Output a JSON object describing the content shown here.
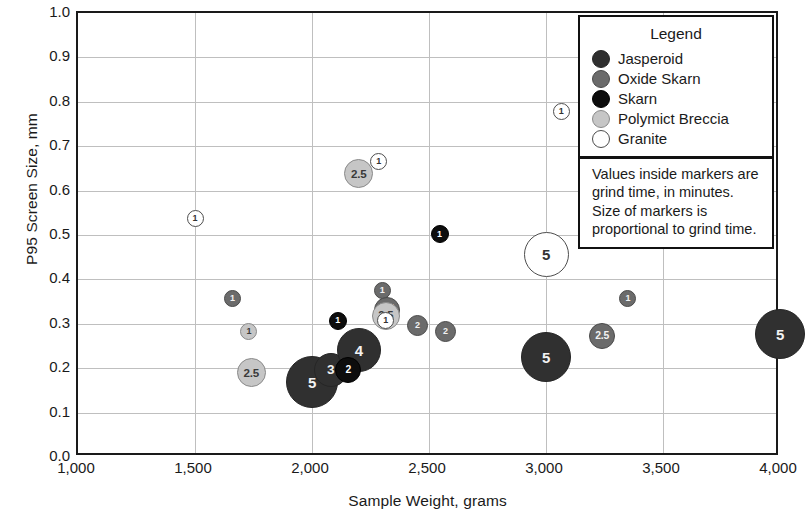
{
  "chart_data": {
    "type": "scatter",
    "title": "",
    "xlabel": "Sample Weight, grams",
    "ylabel": "P95 Screen Size, mm",
    "xlim": [
      1000,
      4000
    ],
    "ylim": [
      0.0,
      1.0
    ],
    "xticks": [
      "1,000",
      "1,500",
      "2,000",
      "2,500",
      "3,000",
      "3,500",
      "4,000"
    ],
    "xtick_values": [
      1000,
      1500,
      2000,
      2500,
      3000,
      3500,
      4000
    ],
    "yticks": [
      "0.0",
      "0.1",
      "0.2",
      "0.3",
      "0.4",
      "0.5",
      "0.6",
      "0.7",
      "0.8",
      "0.9",
      "1.0"
    ],
    "ytick_values": [
      0.0,
      0.1,
      0.2,
      0.3,
      0.4,
      0.5,
      0.6,
      0.7,
      0.8,
      0.9,
      1.0
    ],
    "grid": true,
    "legend_position": "top-right",
    "size_encoding": "marker area proportional to grind time (minutes)",
    "point_label_meaning": "grind time, in minutes",
    "series": [
      {
        "name": "Jasperoid",
        "color": "#303030",
        "points": [
          {
            "x": 2000,
            "y": 0.168,
            "label": "5",
            "d": 52
          },
          {
            "x": 2080,
            "y": 0.196,
            "label": "3",
            "d": 34
          },
          {
            "x": 2200,
            "y": 0.24,
            "label": "4",
            "d": 44
          },
          {
            "x": 3000,
            "y": 0.225,
            "label": "5",
            "d": 50
          },
          {
            "x": 4000,
            "y": 0.277,
            "label": "5",
            "d": 50
          }
        ]
      },
      {
        "name": "Oxide Skarn",
        "color": "#6b6b6b",
        "points": [
          {
            "x": 1660,
            "y": 0.357,
            "label": "1",
            "d": 17
          },
          {
            "x": 2300,
            "y": 0.375,
            "label": "1",
            "d": 17
          },
          {
            "x": 2320,
            "y": 0.332,
            "label": "2.5",
            "d": 26
          },
          {
            "x": 2450,
            "y": 0.297,
            "label": "2",
            "d": 21
          },
          {
            "x": 2570,
            "y": 0.283,
            "label": "2",
            "d": 21
          },
          {
            "x": 3050,
            "y": 0.45,
            "label": "1",
            "d": 17
          },
          {
            "x": 3240,
            "y": 0.272,
            "label": "2.5",
            "d": 26
          },
          {
            "x": 3350,
            "y": 0.358,
            "label": "1",
            "d": 17
          }
        ]
      },
      {
        "name": "Skarn",
        "color": "#0d0d0d",
        "points": [
          {
            "x": 2110,
            "y": 0.307,
            "label": "1",
            "d": 18
          },
          {
            "x": 2155,
            "y": 0.196,
            "label": "2",
            "d": 26
          },
          {
            "x": 2545,
            "y": 0.502,
            "label": "1",
            "d": 18
          }
        ]
      },
      {
        "name": "Polymict Breccia",
        "color": "#c6c6c6",
        "points": [
          {
            "x": 1730,
            "y": 0.283,
            "label": "1",
            "d": 17
          },
          {
            "x": 1740,
            "y": 0.19,
            "label": "2.5",
            "d": 29
          },
          {
            "x": 2200,
            "y": 0.638,
            "label": "2.5",
            "d": 29
          },
          {
            "x": 2315,
            "y": 0.318,
            "label": "2.5",
            "d": 28
          }
        ]
      },
      {
        "name": "Granite",
        "color": "#ffffff",
        "points": [
          {
            "x": 1500,
            "y": 0.537,
            "label": "1",
            "d": 17
          },
          {
            "x": 2285,
            "y": 0.665,
            "label": "1",
            "d": 17
          },
          {
            "x": 2315,
            "y": 0.307,
            "label": "1",
            "d": 17
          },
          {
            "x": 3000,
            "y": 0.457,
            "label": "5",
            "d": 45
          },
          {
            "x": 3065,
            "y": 0.778,
            "label": "1",
            "d": 17
          }
        ]
      }
    ]
  },
  "legend": {
    "title": "Legend",
    "items": [
      {
        "label": "Jasperoid",
        "swatch": "jasperoid"
      },
      {
        "label": "Oxide Skarn",
        "swatch": "oxideskarn"
      },
      {
        "label": "Skarn",
        "swatch": "skarn"
      },
      {
        "label": "Polymict Breccia",
        "swatch": "polymict"
      },
      {
        "label": "Granite",
        "swatch": "granite"
      }
    ],
    "note": "Values inside markers are grind time, in minutes. Size of markers is proportional to grind time."
  }
}
